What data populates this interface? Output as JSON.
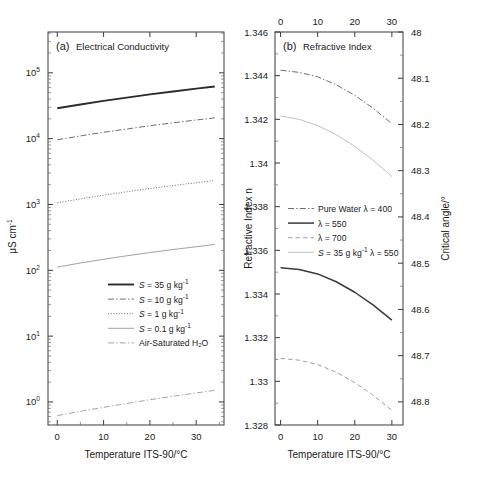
{
  "figure": {
    "width": 479,
    "height": 482,
    "background": "#ffffff",
    "ink": "#1a1a1a"
  },
  "panel_a": {
    "panel_label": "(a)",
    "title": "Electrical Conductivity",
    "xlabel": "Temperature ITS-90/°C",
    "ylabel_parts": {
      "unit": "μS cm",
      "exponent": "-1"
    },
    "xticks": [
      0,
      10,
      20,
      30
    ],
    "xlim": [
      -2,
      36
    ],
    "yticks_exp": [
      0,
      1,
      2,
      3,
      4,
      5
    ],
    "ylim_exp": [
      -0.35,
      5.62
    ],
    "legend": [
      {
        "label_pre": "S",
        "label_post": " = 35 g kg",
        "sup": "-1",
        "style": "solid",
        "width": 1.9,
        "color": "#2b2b2b"
      },
      {
        "label_pre": "S",
        "label_post": " = 10 g kg",
        "sup": "-1",
        "style": "dashdot",
        "width": 1.0,
        "color": "#6e6e6e"
      },
      {
        "label_pre": "S",
        "label_post": " = 1 g kg",
        "sup": "-1",
        "style": "dotted",
        "width": 1.0,
        "color": "#6e6e6e"
      },
      {
        "label_pre": "S",
        "label_post": " = 0.1 g kg",
        "sup": "-1",
        "style": "solid",
        "width": 0.8,
        "color": "#8a8a8a"
      },
      {
        "label_pre": "",
        "label_post": "Air-Saturated H₂O",
        "sup": "",
        "style": "dashdot",
        "width": 0.9,
        "color": "#9a9a9a"
      }
    ]
  },
  "panel_b": {
    "panel_label": "(b)",
    "title": "Refractive Index",
    "xlabel": "Temperature ITS-90/°C",
    "ylabel_left": "Refractive Index n",
    "ylabel_right": "Critical angle/°",
    "xticks": [
      0,
      10,
      20,
      30
    ],
    "xlim": [
      -1.5,
      33
    ],
    "yticks_left": [
      "1.346",
      "1.344",
      "1.342",
      "1.34",
      "1.338",
      "1.336",
      "1.334",
      "1.332",
      "1.33",
      "1.328"
    ],
    "ylim_left": [
      1.328,
      1.346
    ],
    "yticks_right": [
      "48",
      "48.1",
      "48.2",
      "48.3",
      "48.4",
      "48.5",
      "48.6",
      "48.7",
      "48.8"
    ],
    "ylim_right": [
      48.0,
      48.85
    ],
    "legend": [
      {
        "label_pre": "",
        "label_post": "Pure Water λ = 400",
        "sup": "",
        "style": "dashdot",
        "width": 1.0,
        "color": "#6e6e6e"
      },
      {
        "label_pre": "",
        "label_post": "λ = 550",
        "sup": "",
        "style": "solid",
        "width": 1.5,
        "color": "#3a3a3a"
      },
      {
        "label_pre": "",
        "label_post": "λ = 700",
        "sup": "",
        "style": "dashed",
        "width": 1.0,
        "color": "#a0a0a0"
      },
      {
        "label_pre": "S",
        "label_post": " = 35 g kg",
        "sup": "-1",
        "label_tail": " λ = 550",
        "style": "solid",
        "width": 0.8,
        "color": "#b0b0b0"
      }
    ]
  },
  "chart_data": [
    {
      "type": "line",
      "panel": "a",
      "title": "(a) Electrical Conductivity",
      "xlabel": "Temperature ITS-90/°C",
      "ylabel": "μS cm^-1",
      "yscale": "log",
      "xlim": [
        -2,
        36
      ],
      "ylim": [
        0.45,
        420000
      ],
      "grid": false,
      "legend_position": "lower-center-right",
      "x": [
        0,
        5,
        10,
        15,
        20,
        25,
        30,
        34
      ],
      "series": [
        {
          "name": "S = 35 g kg^-1",
          "style": "solid",
          "values": [
            29000,
            33000,
            37500,
            42000,
            47000,
            52000,
            57500,
            62000
          ]
        },
        {
          "name": "S = 10 g kg^-1",
          "style": "dashdot",
          "values": [
            9600,
            11000,
            12500,
            14000,
            15700,
            17400,
            19200,
            20700
          ]
        },
        {
          "name": "S = 1 g kg^-1",
          "style": "dotted",
          "values": [
            1060,
            1215,
            1385,
            1560,
            1745,
            1940,
            2140,
            2310
          ]
        },
        {
          "name": "S = 0.1 g kg^-1",
          "style": "solid-thin",
          "values": [
            112,
            129,
            147,
            166,
            186,
            207,
            228,
            247
          ]
        },
        {
          "name": "Air-Saturated H2O",
          "style": "dashdot-thin",
          "values": [
            0.62,
            0.72,
            0.83,
            0.95,
            1.08,
            1.22,
            1.37,
            1.5
          ]
        }
      ]
    },
    {
      "type": "line",
      "panel": "b",
      "title": "(b) Refractive Index",
      "xlabel": "Temperature ITS-90/°C",
      "ylabel": "Refractive Index n",
      "ylabel_secondary": "Critical angle/°",
      "yscale": "linear",
      "xlim": [
        -1.5,
        33
      ],
      "ylim": [
        1.328,
        1.346
      ],
      "ylim_secondary": [
        48.0,
        48.85
      ],
      "secondary_axis_inverted": true,
      "grid": false,
      "legend_position": "middle-right",
      "x": [
        0,
        5,
        10,
        15,
        20,
        25,
        30
      ],
      "series": [
        {
          "name": "Pure Water λ = 400",
          "style": "dashdot",
          "values": [
            1.34425,
            1.34415,
            1.34395,
            1.34358,
            1.3431,
            1.3425,
            1.3418
          ]
        },
        {
          "name": "λ = 550",
          "style": "solid",
          "values": [
            1.3352,
            1.33512,
            1.33492,
            1.33456,
            1.33408,
            1.33349,
            1.3328
          ]
        },
        {
          "name": "λ = 700",
          "style": "dashed",
          "values": [
            1.33105,
            1.33097,
            1.33077,
            1.33042,
            1.32994,
            1.32936,
            1.32867
          ]
        },
        {
          "name": "S = 35 g kg^-1 λ = 550",
          "style": "solid-thin",
          "values": [
            1.34215,
            1.342,
            1.34172,
            1.3413,
            1.34076,
            1.34012,
            1.33938
          ]
        }
      ]
    }
  ]
}
